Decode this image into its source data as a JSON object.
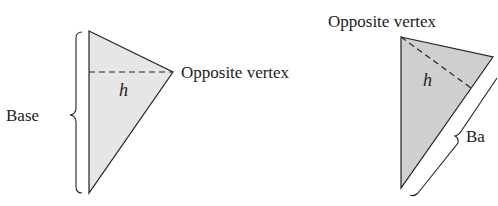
{
  "figures": [
    {
      "id": "left",
      "base_label": "Base",
      "height_label": "h",
      "vertex_label": "Opposite vertex",
      "fill": "#e6e6e6"
    },
    {
      "id": "right",
      "base_label": "Ba",
      "height_label": "h",
      "vertex_label": "Opposite vertex",
      "fill": "#cfcfcf"
    }
  ],
  "colors": {
    "stroke": "#222222",
    "background": "#ffffff"
  }
}
